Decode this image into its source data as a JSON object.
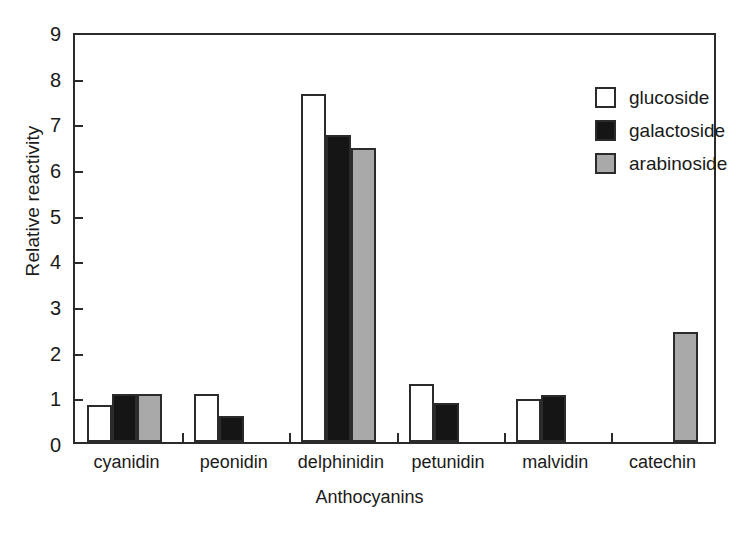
{
  "chart_data": {
    "type": "bar",
    "title": "",
    "xlabel": "Anthocyanins",
    "ylabel": "Relative reactivity",
    "ylim": [
      0,
      9
    ],
    "ytick_step": 1,
    "yticks": [
      0,
      1,
      2,
      3,
      4,
      5,
      6,
      7,
      8,
      9
    ],
    "grid": false,
    "legend_position": "top-right",
    "categories": [
      "cyanidin",
      "peonidin",
      "delphinidin",
      "petunidin",
      "malvidin",
      "catechin"
    ],
    "series": [
      {
        "name": "glucoside",
        "color": "#ffffff",
        "values": [
          0.82,
          1.05,
          7.63,
          1.28,
          0.95,
          0
        ]
      },
      {
        "name": "galactoside",
        "color": "#151515",
        "values": [
          1.05,
          0.57,
          6.72,
          0.85,
          1.04,
          0
        ]
      },
      {
        "name": "arabinoside",
        "color": "#a9a9a9",
        "values": [
          1.06,
          0,
          6.44,
          0,
          0,
          2.42
        ]
      }
    ]
  },
  "legend": {
    "items": [
      {
        "label": "glucoside",
        "swatch": "glucoside"
      },
      {
        "label": "galactoside",
        "swatch": "galactoside"
      },
      {
        "label": "arabinoside",
        "swatch": "arabinoside"
      }
    ]
  },
  "axes": {
    "y_title": "Relative reactivity",
    "x_title": "Anthocyanins",
    "y_tick_labels": [
      "0",
      "1",
      "2",
      "3",
      "4",
      "5",
      "6",
      "7",
      "8",
      "9"
    ]
  },
  "colors": {
    "axis": "#2b2b2b",
    "glucoside": "#ffffff",
    "galactoside": "#151515",
    "arabinoside": "#a9a9a9",
    "background": "#ffffff"
  }
}
